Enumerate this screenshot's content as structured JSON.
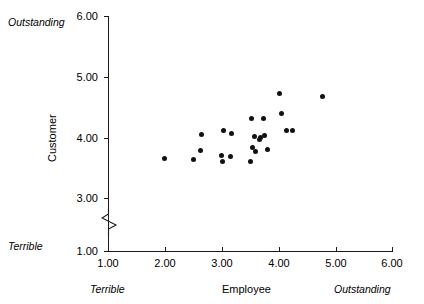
{
  "chart_data": {
    "type": "scatter",
    "title": "",
    "xlabel": "Employee",
    "ylabel": "Customer",
    "xlim": [
      1.0,
      6.0
    ],
    "ylim": [
      1.0,
      6.0
    ],
    "grid": false,
    "legend": "none",
    "y_axis_break": true,
    "y_axis_break_between": [
      1.0,
      3.0
    ],
    "x_ticks": [
      "1.00",
      "2.00",
      "3.00",
      "4.00",
      "5.00",
      "6.00"
    ],
    "y_ticks": [
      "1.00",
      "3.00",
      "4.00",
      "5.00",
      "6.00"
    ],
    "x_anchor_low": "Terrible",
    "x_anchor_high": "Outstanding",
    "y_anchor_low": "Terrible",
    "y_anchor_high": "Outstanding",
    "points": [
      {
        "x": 2.0,
        "y": 3.65
      },
      {
        "x": 2.5,
        "y": 3.63
      },
      {
        "x": 2.62,
        "y": 3.79
      },
      {
        "x": 2.65,
        "y": 4.04
      },
      {
        "x": 3.0,
        "y": 3.7
      },
      {
        "x": 3.02,
        "y": 3.6
      },
      {
        "x": 3.03,
        "y": 4.12
      },
      {
        "x": 3.15,
        "y": 3.69
      },
      {
        "x": 3.18,
        "y": 4.06
      },
      {
        "x": 3.5,
        "y": 3.6
      },
      {
        "x": 3.52,
        "y": 4.31
      },
      {
        "x": 3.55,
        "y": 3.83
      },
      {
        "x": 3.58,
        "y": 4.01
      },
      {
        "x": 3.6,
        "y": 3.76
      },
      {
        "x": 3.66,
        "y": 3.96
      },
      {
        "x": 3.68,
        "y": 3.99
      },
      {
        "x": 3.74,
        "y": 4.31
      },
      {
        "x": 3.76,
        "y": 4.03
      },
      {
        "x": 3.8,
        "y": 3.8
      },
      {
        "x": 4.02,
        "y": 4.73
      },
      {
        "x": 4.06,
        "y": 4.39
      },
      {
        "x": 4.14,
        "y": 4.12
      },
      {
        "x": 4.25,
        "y": 4.11
      },
      {
        "x": 4.78,
        "y": 4.68
      }
    ]
  },
  "labels": {
    "y_title": "Customer",
    "x_title": "Employee",
    "y_top_anchor": "Outstanding",
    "y_bottom_anchor": "Terrible",
    "x_left_anchor": "Terrible",
    "x_right_anchor": "Outstanding"
  },
  "ticks": {
    "y": [
      {
        "value": "6.00",
        "px": 16
      },
      {
        "value": "5.00",
        "px": 77
      },
      {
        "value": "4.00",
        "px": 138
      },
      {
        "value": "3.00",
        "px": 198
      },
      {
        "value": "1.00",
        "px": 251
      }
    ],
    "x": [
      {
        "value": "1.00",
        "px": 108
      },
      {
        "value": "2.00",
        "px": 165
      },
      {
        "value": "3.00",
        "px": 222
      },
      {
        "value": "4.00",
        "px": 279
      },
      {
        "value": "5.00",
        "px": 336
      },
      {
        "value": "6.00",
        "px": 392
      }
    ]
  },
  "colors": {
    "axis": "#1a1a1a",
    "point": "#111111",
    "background": "#ffffff"
  }
}
